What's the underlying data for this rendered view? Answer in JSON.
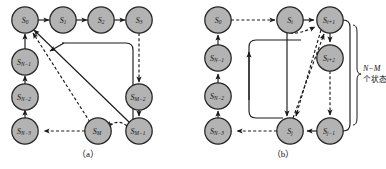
{
  "figure": {
    "type": "diagram",
    "colors": {
      "node_fill": "#b3b3b3",
      "node_stroke": "#262626",
      "edge": "#1a1a1a",
      "background": "#ffffff"
    }
  },
  "panel_a": {
    "caption": "（a）",
    "nodes": [
      {
        "id": "s0",
        "base": "S",
        "sub": "0",
        "cx": 25,
        "cy": 20
      },
      {
        "id": "s1",
        "base": "S",
        "sub": "1",
        "cx": 63,
        "cy": 20
      },
      {
        "id": "s2",
        "base": "S",
        "sub": "2",
        "cx": 101,
        "cy": 20
      },
      {
        "id": "s3",
        "base": "S",
        "sub": "3",
        "cx": 139,
        "cy": 20
      },
      {
        "id": "sn1",
        "base": "S",
        "sub": "N−1",
        "cx": 25,
        "cy": 62
      },
      {
        "id": "sn2",
        "base": "S",
        "sub": "N−2",
        "cx": 25,
        "cy": 97
      },
      {
        "id": "sn3",
        "base": "S",
        "sub": "N−3",
        "cx": 25,
        "cy": 131
      },
      {
        "id": "sm2",
        "base": "S",
        "sub": "M−2",
        "cx": 139,
        "cy": 97
      },
      {
        "id": "sm1",
        "base": "S",
        "sub": "M−1",
        "cx": 139,
        "cy": 131
      },
      {
        "id": "sm",
        "base": "S",
        "sub": "M",
        "cx": 98,
        "cy": 131
      }
    ],
    "edges": [
      {
        "from": "s0",
        "to": "s1",
        "style": "solid"
      },
      {
        "from": "s1",
        "to": "s2",
        "style": "solid"
      },
      {
        "from": "s2",
        "to": "s3",
        "style": "solid"
      },
      {
        "from": "s3",
        "to": "sm2",
        "style": "dashed"
      },
      {
        "from": "sm2",
        "to": "sm1",
        "style": "solid"
      },
      {
        "from": "sm1",
        "to": "sm",
        "style": "dashed"
      },
      {
        "from": "sm",
        "to": "sn3",
        "style": "dashed"
      },
      {
        "from": "sn3",
        "to": "sn2",
        "style": "solid"
      },
      {
        "from": "sn2",
        "to": "sn1",
        "style": "solid"
      },
      {
        "from": "sn1",
        "to": "s0",
        "style": "solid"
      },
      {
        "from": "sm1",
        "to": "s0",
        "style": "solid",
        "kind": "long-return"
      },
      {
        "from": "sm",
        "to": "s0",
        "style": "dashed",
        "kind": "long-return"
      },
      {
        "from": "sm1",
        "to": "mid",
        "style": "solid",
        "kind": "rounded-loop"
      }
    ]
  },
  "panel_b": {
    "caption": "（b）",
    "brace_label_line1": "N−M",
    "brace_label_line2": "个状态",
    "nodes": [
      {
        "id": "s0",
        "base": "S",
        "sub": "0",
        "cx": 25,
        "cy": 20
      },
      {
        "id": "si",
        "base": "S",
        "sub": "i",
        "cx": 97,
        "cy": 20
      },
      {
        "id": "si1",
        "base": "S",
        "sub": "i+1",
        "cx": 137,
        "cy": 20
      },
      {
        "id": "si2",
        "base": "S",
        "sub": "i+2",
        "cx": 137,
        "cy": 58
      },
      {
        "id": "sn1",
        "base": "S",
        "sub": "N−1",
        "cx": 25,
        "cy": 58
      },
      {
        "id": "sn2",
        "base": "S",
        "sub": "N−2",
        "cx": 25,
        "cy": 96
      },
      {
        "id": "sn3",
        "base": "S",
        "sub": "N−3",
        "cx": 25,
        "cy": 131
      },
      {
        "id": "sj",
        "base": "S",
        "sub": "j",
        "cx": 97,
        "cy": 131
      },
      {
        "id": "sj1",
        "base": "S",
        "sub": "j−1",
        "cx": 137,
        "cy": 131
      }
    ],
    "edges": [
      {
        "from": "s0",
        "to": "si",
        "style": "dashed"
      },
      {
        "from": "si",
        "to": "si1",
        "style": "solid"
      },
      {
        "from": "si1",
        "to": "si2",
        "style": "solid"
      },
      {
        "from": "si2",
        "to": "sj1",
        "style": "dashed"
      },
      {
        "from": "sj1",
        "to": "sj",
        "style": "solid"
      },
      {
        "from": "sj",
        "to": "sn3",
        "style": "dashed"
      },
      {
        "from": "sn3",
        "to": "sn2",
        "style": "dashed"
      },
      {
        "from": "sn2",
        "to": "sn1",
        "style": "solid"
      },
      {
        "from": "sn1",
        "to": "s0",
        "style": "solid"
      },
      {
        "from": "si",
        "to": "sj",
        "style": "solid"
      },
      {
        "from": "sj",
        "to": "si1",
        "style": "dashed"
      },
      {
        "from": "si1",
        "to": "sj",
        "style": "dashed"
      },
      {
        "from": "sj1",
        "to": "si1",
        "style": "solid",
        "kind": "right-bypass"
      },
      {
        "from": "sj",
        "to": "up",
        "style": "solid",
        "kind": "rounded-loop"
      }
    ]
  }
}
